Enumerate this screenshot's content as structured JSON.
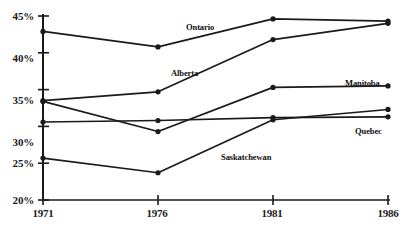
{
  "chart_data": {
    "type": "line",
    "title": "",
    "subtitle": "",
    "xlabel": "",
    "ylabel": "",
    "x": [
      1971,
      1976,
      1981,
      1986
    ],
    "xtick_labels": [
      "1971",
      "1976",
      "1981",
      "1986"
    ],
    "ytick_labels": [
      "20%",
      "25%",
      "30%",
      "35%",
      "40%",
      "45%"
    ],
    "ytick_values": [
      20,
      25,
      30,
      35,
      40,
      45
    ],
    "ylim": [
      20,
      45
    ],
    "xlim": [
      1971,
      1986
    ],
    "grid": false,
    "legend_position": "inline-annotations",
    "value_unit": "percent",
    "marker": "filled-circle",
    "line_color": "#1a1a1a",
    "series": [
      {
        "name": "Ontario",
        "values": [
          42.9,
          40.8,
          44.6,
          44.3
        ]
      },
      {
        "name": "Alberta",
        "values": [
          33.5,
          34.7,
          41.8,
          44.0
        ]
      },
      {
        "name": "Manitoba",
        "values": [
          33.4,
          29.3,
          35.3,
          35.5
        ]
      },
      {
        "name": "Quebec",
        "values": [
          30.6,
          30.8,
          31.2,
          31.3
        ]
      },
      {
        "name": "Saskatchewan",
        "values": [
          25.7,
          23.7,
          30.9,
          32.3
        ]
      }
    ],
    "annotations": [
      {
        "text": "Ontario",
        "x": 186,
        "y": 22
      },
      {
        "text": "Alberta",
        "x": 171,
        "y": 68
      },
      {
        "text": "Manitoba",
        "x": 345,
        "y": 78
      },
      {
        "text": "Quebec",
        "x": 355,
        "y": 126
      },
      {
        "text": "Saskatchewan",
        "x": 221,
        "y": 152
      }
    ]
  },
  "axes": {
    "y_labels": [
      {
        "text": "45%",
        "top": 10
      },
      {
        "text": "40%",
        "top": 52
      },
      {
        "text": "35%",
        "top": 94
      },
      {
        "text": "30%",
        "top": 136
      },
      {
        "text": "25%",
        "top": 157
      },
      {
        "text": "20%",
        "top": 194
      }
    ],
    "x_labels": [
      {
        "text": "1971",
        "left": 23
      },
      {
        "text": "1976",
        "left": 137
      },
      {
        "text": "1981",
        "left": 252
      },
      {
        "text": "1986",
        "left": 368
      }
    ]
  }
}
